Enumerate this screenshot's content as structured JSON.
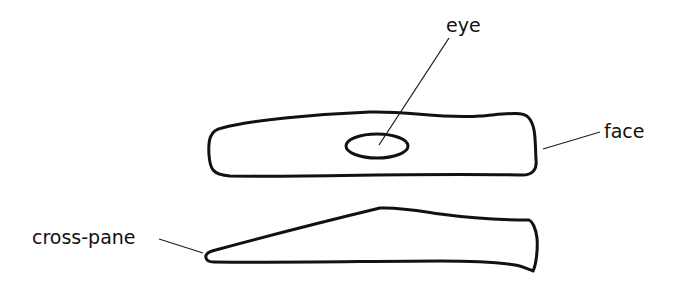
{
  "diagram": {
    "title": "",
    "components": [
      {
        "id": "top-view",
        "description": "hammer head top view with eye"
      },
      {
        "id": "side-view",
        "description": "hammer head side view tapering to cross-pane"
      }
    ],
    "labels": {
      "eye": "eye",
      "face": "face",
      "cross_pane": "cross-pane"
    },
    "colors": {
      "stroke": "#111111",
      "background": "#ffffff"
    }
  }
}
